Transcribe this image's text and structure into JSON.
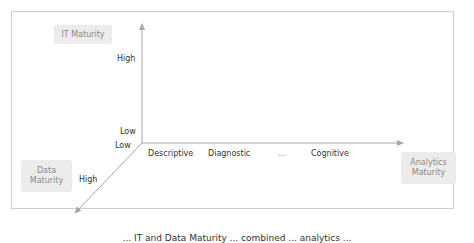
{
  "diagram": {
    "axes": {
      "it_maturity": {
        "title": "IT Maturity",
        "high": "High",
        "low": "Low"
      },
      "data_maturity": {
        "title": "Data Maturity",
        "high": "High",
        "low": "Low"
      },
      "analytics_maturity": {
        "title": "Analytics Maturity",
        "levels": [
          "Descriptive",
          "Diagnostic",
          "...",
          "Cognitive"
        ]
      }
    },
    "caption": "... IT and Data Maturity ... combined ... analytics ..."
  },
  "colors": {
    "axis": "#a6a6a6",
    "pill_bg": "#ececec",
    "pill_text": "#8a8a8a",
    "frame": "#cfcfcf"
  }
}
